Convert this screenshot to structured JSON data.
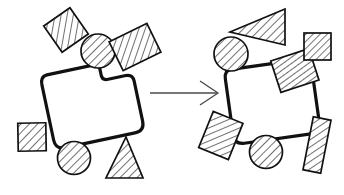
{
  "figure": {
    "background_color": "#ffffff",
    "stroke_color": "#111111",
    "hatch_color": "#1a1a1a",
    "arrow_color": "#4a4a4a",
    "width": 344,
    "height": 195
  },
  "panels": {
    "left": {
      "name": "before-assembly",
      "label": "",
      "body": {
        "name": "notched-body-left",
        "fill": "#ffffff",
        "rotation_deg": -12,
        "center": [
          93,
          104
        ],
        "notch": "top-center-rectangular"
      },
      "pieces": [
        {
          "id": "l1",
          "shape": "square",
          "hatch": "diagonal",
          "cx": 66,
          "cy": 30,
          "size": 32,
          "rotation_deg": -35,
          "fill": "#ffffff"
        },
        {
          "id": "l2",
          "shape": "circle",
          "hatch": "diagonal",
          "cx": 98,
          "cy": 51,
          "size": 34,
          "rotation_deg": 0,
          "fill": "#ffffff"
        },
        {
          "id": "l3",
          "shape": "rectangle",
          "hatch": "diagonal",
          "cx": 135,
          "cy": 47,
          "size": 36,
          "rotation_deg": -26,
          "fill": "#ffffff"
        },
        {
          "id": "l4",
          "shape": "square",
          "hatch": "diagonal",
          "cx": 32,
          "cy": 137,
          "size": 29,
          "rotation_deg": 0,
          "fill": "#ffffff"
        },
        {
          "id": "l5",
          "shape": "circle",
          "hatch": "diagonal",
          "cx": 74,
          "cy": 158,
          "size": 33,
          "rotation_deg": 0,
          "fill": "#ffffff"
        },
        {
          "id": "l6",
          "shape": "triangle",
          "hatch": "diagonal",
          "cx": 124,
          "cy": 160,
          "size": 36,
          "rotation_deg": 0,
          "fill": "#ffffff"
        }
      ]
    },
    "right": {
      "name": "after-assembly",
      "label": "",
      "body": {
        "name": "notched-body-right",
        "fill": "#ffffff",
        "rotation_deg": -8,
        "center": [
          272,
          102
        ],
        "notch": "top-center-rectangular",
        "inserted_piece": {
          "id": "r-inserted",
          "shape": "rectangle",
          "hatch": "diagonal",
          "cx": 295,
          "cy": 71,
          "size": 33,
          "rotation_deg": -18,
          "fill": "#ffffff"
        }
      },
      "pieces": [
        {
          "id": "r1",
          "shape": "triangle",
          "hatch": "diagonal",
          "cx": 258,
          "cy": 26,
          "size": 36,
          "rotation_deg": -100,
          "fill": "#ffffff"
        },
        {
          "id": "r2",
          "shape": "circle",
          "hatch": "diagonal",
          "cx": 231,
          "cy": 54,
          "size": 34,
          "rotation_deg": 0,
          "fill": "#ffffff"
        },
        {
          "id": "r3",
          "shape": "square",
          "hatch": "diagonal",
          "cx": 317,
          "cy": 47,
          "size": 27,
          "rotation_deg": 0,
          "fill": "#ffffff"
        },
        {
          "id": "r4",
          "shape": "rectangle",
          "hatch": "diagonal",
          "cx": 221,
          "cy": 135,
          "size": 36,
          "rotation_deg": 22,
          "fill": "#ffffff"
        },
        {
          "id": "r5",
          "shape": "circle",
          "hatch": "diagonal",
          "cx": 266,
          "cy": 152,
          "size": 33,
          "rotation_deg": 0,
          "fill": "#ffffff"
        },
        {
          "id": "r6",
          "shape": "rectangle",
          "hatch": "diagonal",
          "cx": 317,
          "cy": 145,
          "size": 34,
          "rotation_deg": 11,
          "fill": "#ffffff"
        }
      ]
    }
  },
  "arrow": {
    "name": "transform-arrow",
    "label": "",
    "x1": 150,
    "y1": 93,
    "x2": 217,
    "y2": 93,
    "head_length": 17,
    "color": "#4a4a4a"
  }
}
